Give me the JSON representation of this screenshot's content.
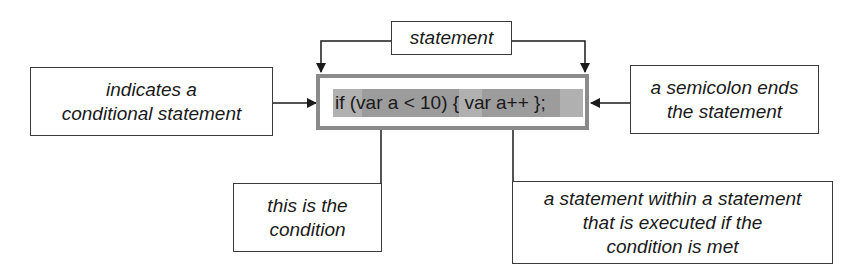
{
  "diagram": {
    "title_label": "statement",
    "code": {
      "prefix": "if ",
      "condition": "(var a < 10)",
      "middle": " { ",
      "inner_statement": "var a++",
      "suffix": " };"
    },
    "annotations": {
      "conditional": "indicates a\nconditional statement",
      "semicolon": "a semicolon ends\nthe statement",
      "condition": "this is the\ncondition",
      "inner": "a statement within a statement\nthat is executed if the\ncondition is met"
    },
    "colors": {
      "line": "#1a1a1a",
      "code_border": "#8a8a8a",
      "highlight_light": "#b0b0b0",
      "highlight_dark": "#9c9c9c"
    }
  }
}
